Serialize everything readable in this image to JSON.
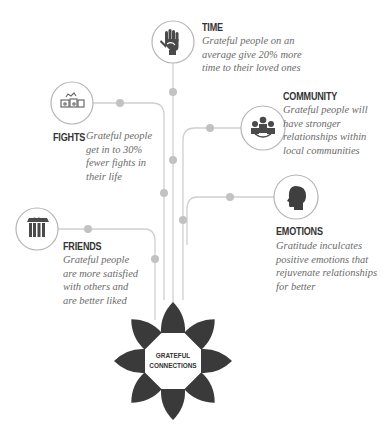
{
  "diagram": {
    "center": {
      "line1": "GRATEFUL",
      "line2": "CONNECTIONS"
    },
    "nodes": [
      {
        "id": "time",
        "title": "TIME",
        "icon": "hand-icon",
        "description": [
          "Grateful people on an",
          "average give 20% more",
          "time to their loved ones"
        ]
      },
      {
        "id": "fights",
        "title": "FIGHTS",
        "icon": "fights-icon",
        "description": [
          "Grateful people",
          "get in to 30%",
          "fewer fights in",
          "their life"
        ]
      },
      {
        "id": "community",
        "title": "COMMUNITY",
        "icon": "community-icon",
        "description": [
          "Grateful people will",
          "have stronger",
          "relationships within",
          "local communities"
        ]
      },
      {
        "id": "emotions",
        "title": "EMOTIONS",
        "icon": "head-icon",
        "description": [
          "Gratitude inculcates",
          "positive emotions that",
          "rejuvenate relationships",
          "for better"
        ]
      },
      {
        "id": "friends",
        "title": "FRIENDS",
        "icon": "friends-icon",
        "description": [
          "Grateful people",
          "are more satisfied",
          "with others and",
          "are better liked"
        ]
      }
    ],
    "colors": {
      "line": "#cccccc",
      "dot": "#bdbdbd",
      "icon": "#4a4a4a",
      "petal": "#3a3a3a",
      "circle_stroke": "#b0b0b0",
      "title": "#333333",
      "desc": "#6b6b6b"
    }
  }
}
